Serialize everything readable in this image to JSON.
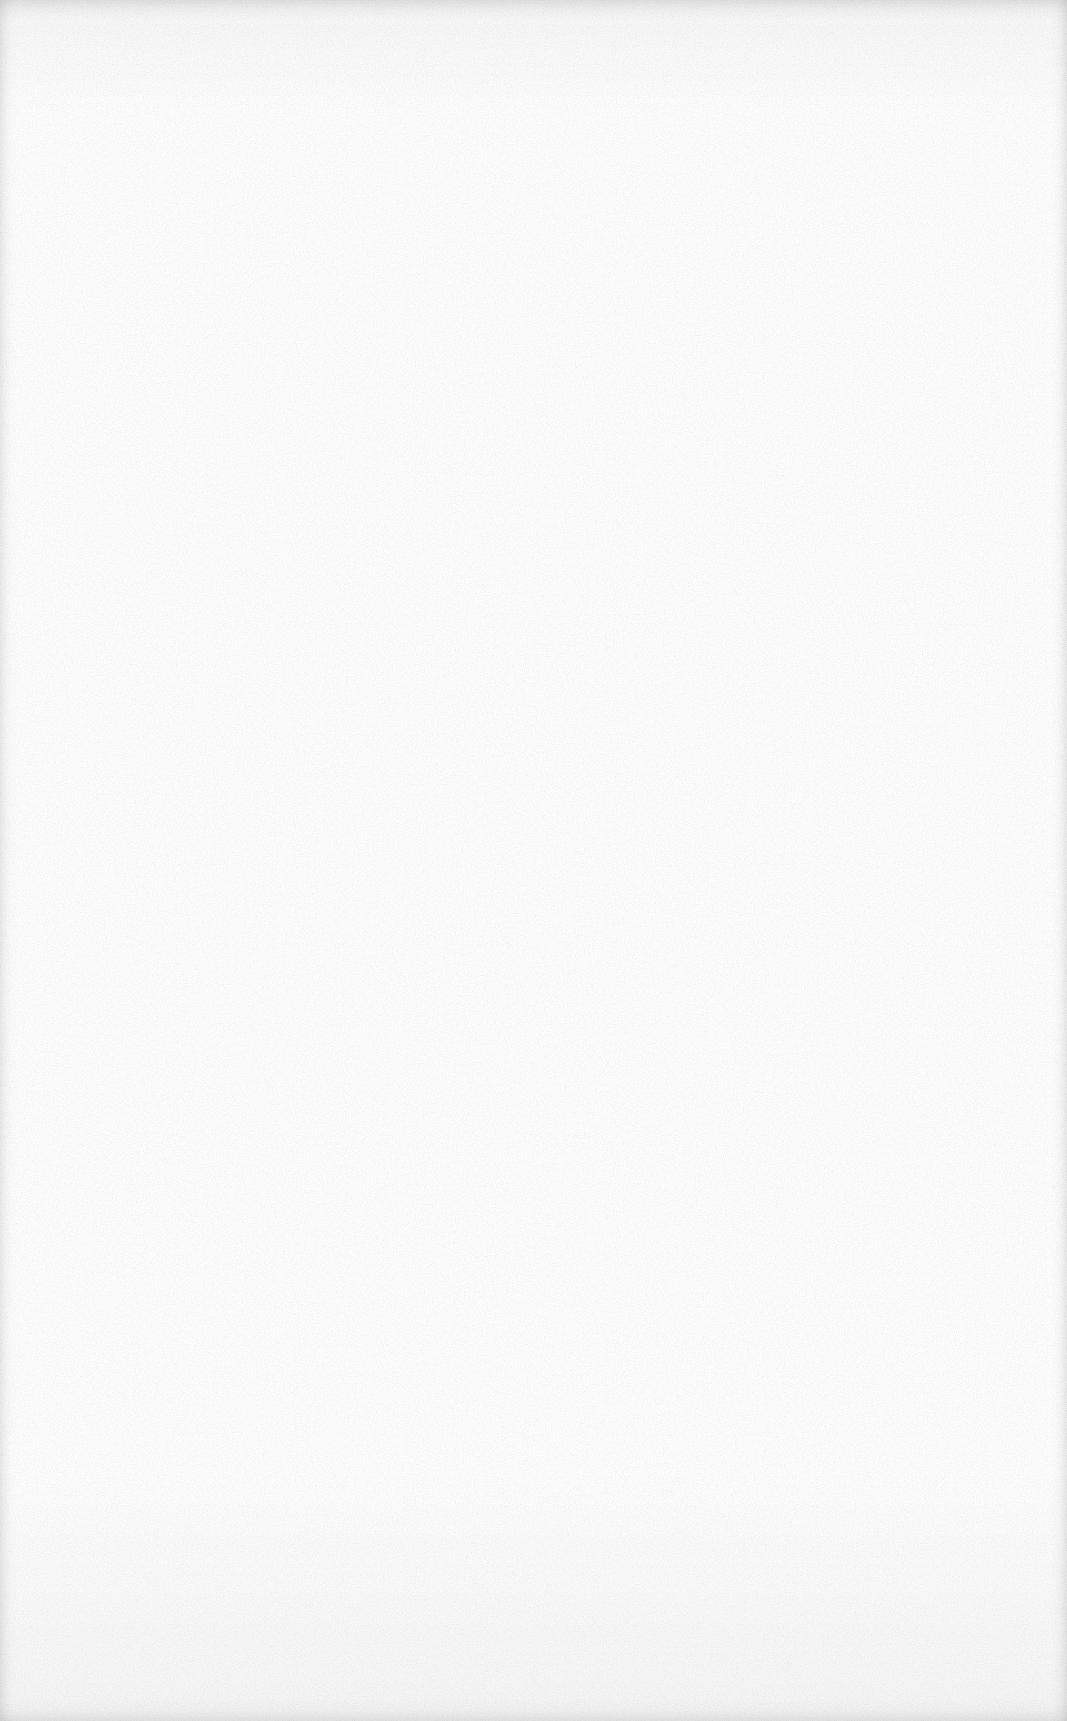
{
  "document": {
    "type": "blank-scanned-page",
    "content": []
  },
  "colors": {
    "paper": "#fdfdfd",
    "speckle": "#9a9a9a",
    "edge_shadow": "#e6e6e6"
  }
}
